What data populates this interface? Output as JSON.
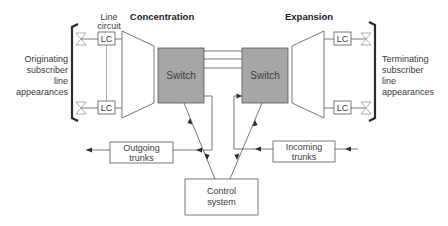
{
  "diagram": {
    "labels": {
      "line_circuit_1": "Line",
      "line_circuit_2": "circuit",
      "concentration": "Concentration",
      "expansion": "Expansion",
      "switch_left": "Switch",
      "switch_right": "Switch",
      "lc": "LC",
      "originating": [
        "Originating",
        "subscriber",
        "line",
        "appearances"
      ],
      "terminating": [
        "Terminating",
        "subscriber",
        "line",
        "appearances"
      ],
      "outgoing": [
        "Outgoing",
        "trunks"
      ],
      "incoming": [
        "Incoming",
        "trunks"
      ],
      "control": [
        "Control",
        "system"
      ]
    },
    "colors": {
      "switch_fill": "#a6a6a6",
      "line": "#555555",
      "bracket": "#2a2a2a"
    }
  }
}
